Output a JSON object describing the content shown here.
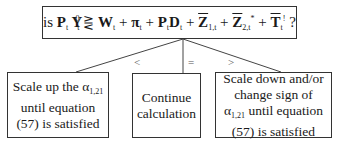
{
  "question": {
    "prefix": "is ",
    "lhs": "P",
    "lhs_sub": "t",
    "y": " Y",
    "y_sub": "t",
    "y_sup": "0",
    "comparator": "⋛",
    "terms": [
      {
        "text": "W",
        "sub": "t",
        "overline": false
      },
      {
        "text": "π",
        "sub": "t",
        "overline": false
      },
      {
        "text": "P",
        "sub": "t",
        "overline": false
      },
      {
        "text": "D",
        "sub": "t",
        "overline": false
      },
      {
        "text": "Z",
        "sub": "1,t",
        "overline": true
      },
      {
        "text": "Z",
        "sub": "2,t",
        "sup": "*",
        "overline": true
      },
      {
        "text": "T",
        "sub": "t",
        "sup": "!",
        "overline": true
      }
    ],
    "suffix": " ?"
  },
  "branches": [
    {
      "symbol": "<",
      "line1": "Scale up the α",
      "alpha_sub": "1,21",
      "line2": "until equation",
      "line3": "(57) is satisfied"
    },
    {
      "symbol": "=",
      "line1": "Continue",
      "line2": "calculation"
    },
    {
      "symbol": ">",
      "line1": "Scale down and/or",
      "line2": "change sign of",
      "line3_alpha": "α",
      "alpha_sub": "1,21",
      "line3_rest": " until equation",
      "line4": "(57) is satisfied"
    }
  ],
  "colors": {
    "border": "#333333",
    "text": "#1a1a1a",
    "label": "#555555"
  }
}
